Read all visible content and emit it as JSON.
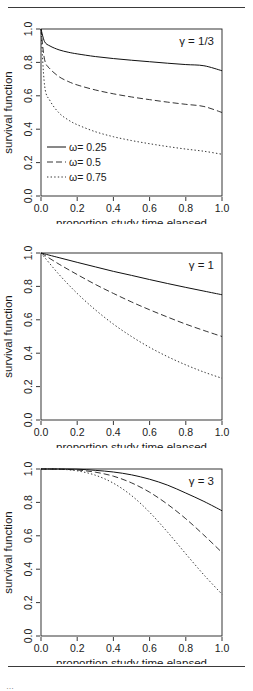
{
  "figure": {
    "rules": [
      "top-rule",
      "bottom-rule"
    ],
    "caption_fragment": "…"
  },
  "axes": {
    "xlabel": "proportion study time elapsed",
    "ylabel": "survival function",
    "xticks": [
      "0.0",
      "0.2",
      "0.4",
      "0.6",
      "0.8",
      "1.0"
    ],
    "yticks": [
      "0.0",
      "0.2",
      "0.4",
      "0.6",
      "0.8",
      "1.0"
    ],
    "xlim": [
      0,
      1
    ],
    "ylim": [
      0,
      1
    ]
  },
  "legend": {
    "position": "bottom-left",
    "entries": [
      {
        "label": "ω= 0.25",
        "style": "solid"
      },
      {
        "label": "ω= 0.5",
        "style": "dashed"
      },
      {
        "label": "ω= 0.75",
        "style": "dotted"
      }
    ]
  },
  "panels": [
    {
      "id": "panel-gamma-one-third",
      "annotation": "γ = 1/3",
      "has_legend": true
    },
    {
      "id": "panel-gamma-1",
      "annotation": "γ = 1",
      "has_legend": false
    },
    {
      "id": "panel-gamma-3",
      "annotation": "γ = 3",
      "has_legend": false
    }
  ],
  "colors": {
    "line": "#101010",
    "axis": "#202020",
    "rule": "#3a3a3a",
    "background": "#ffffff"
  },
  "chart_data": [
    {
      "type": "line",
      "title": "γ = 1/3",
      "xlabel": "proportion study time elapsed",
      "ylabel": "survival function",
      "xlim": [
        0,
        1
      ],
      "ylim": [
        0,
        1
      ],
      "grid": false,
      "legend_position": "bottom-left",
      "x": [
        0,
        0.02,
        0.05,
        0.1,
        0.15,
        0.2,
        0.3,
        0.4,
        0.5,
        0.6,
        0.7,
        0.8,
        0.9,
        1.0
      ],
      "series": [
        {
          "name": "ω= 0.25",
          "style": "solid",
          "values": [
            1.0,
            0.924,
            0.898,
            0.875,
            0.861,
            0.851,
            0.835,
            0.823,
            0.813,
            0.804,
            0.795,
            0.787,
            0.78,
            0.75
          ]
        },
        {
          "name": "ω= 0.5",
          "style": "dashed",
          "values": [
            1.0,
            0.816,
            0.761,
            0.714,
            0.686,
            0.665,
            0.635,
            0.612,
            0.593,
            0.577,
            0.562,
            0.549,
            0.536,
            0.5
          ]
        },
        {
          "name": "ω= 0.75",
          "style": "dotted",
          "values": [
            1.0,
            0.66,
            0.57,
            0.497,
            0.456,
            0.427,
            0.385,
            0.355,
            0.332,
            0.313,
            0.296,
            0.281,
            0.268,
            0.25
          ]
        }
      ]
    },
    {
      "type": "line",
      "title": "γ = 1",
      "xlabel": "proportion study time elapsed",
      "ylabel": "survival function",
      "xlim": [
        0,
        1
      ],
      "ylim": [
        0,
        1
      ],
      "grid": false,
      "legend_position": "none",
      "x": [
        0,
        0.1,
        0.2,
        0.3,
        0.4,
        0.5,
        0.6,
        0.7,
        0.8,
        0.9,
        1.0
      ],
      "series": [
        {
          "name": "ω= 0.25",
          "style": "solid",
          "values": [
            1.0,
            0.972,
            0.944,
            0.917,
            0.89,
            0.866,
            0.841,
            0.817,
            0.794,
            0.772,
            0.75
          ]
        },
        {
          "name": "ω= 0.5",
          "style": "dashed",
          "values": [
            1.0,
            0.933,
            0.871,
            0.812,
            0.758,
            0.707,
            0.66,
            0.616,
            0.574,
            0.536,
            0.5
          ]
        },
        {
          "name": "ω= 0.75",
          "style": "dotted",
          "values": [
            1.0,
            0.871,
            0.758,
            0.66,
            0.574,
            0.5,
            0.435,
            0.379,
            0.33,
            0.287,
            0.25
          ]
        }
      ]
    },
    {
      "type": "line",
      "title": "γ = 3",
      "xlabel": "proportion study time elapsed",
      "ylabel": "survival function",
      "xlim": [
        0,
        1
      ],
      "ylim": [
        0,
        1
      ],
      "grid": false,
      "legend_position": "none",
      "x": [
        0,
        0.1,
        0.2,
        0.3,
        0.4,
        0.5,
        0.6,
        0.7,
        0.8,
        0.9,
        1.0
      ],
      "series": [
        {
          "name": "ω= 0.25",
          "style": "solid",
          "values": [
            1.0,
            1.0,
            0.999,
            0.992,
            0.982,
            0.965,
            0.939,
            0.903,
            0.856,
            0.806,
            0.75
          ]
        },
        {
          "name": "ω= 0.5",
          "style": "dashed",
          "values": [
            1.0,
            0.999,
            0.994,
            0.981,
            0.957,
            0.917,
            0.861,
            0.788,
            0.702,
            0.604,
            0.5
          ]
        },
        {
          "name": "ω= 0.75",
          "style": "dotted",
          "values": [
            1.0,
            0.999,
            0.989,
            0.963,
            0.915,
            0.841,
            0.741,
            0.621,
            0.492,
            0.366,
            0.25
          ]
        }
      ]
    }
  ]
}
